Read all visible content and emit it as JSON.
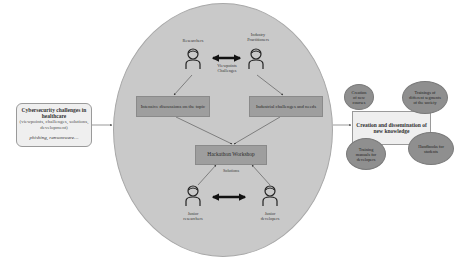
{
  "diagram": {
    "input": {
      "title": "Cybersecurity challenges in healthcare",
      "subtitle": "(viewpoints, challenges, solutions, development)",
      "examples": "phishing, ransomware…"
    },
    "center": {
      "top_left_actor": "Researchers",
      "top_right_actor": "Industry Practitioners",
      "top_exchange_label": "Viewpoints Challenges",
      "left_box": "Intensive discussions on the topic",
      "right_box": "Industrial challenges and needs",
      "hub_box": "Hackathon Workshop",
      "hub_label": "Solutions",
      "bottom_left_actor": "Junior researchers",
      "bottom_right_actor": "Junior developers"
    },
    "output": {
      "title": "Creation and dissemination of new knowledge",
      "outcomes": [
        "Creation of new courses",
        "Trainings of different segments of the society",
        "Training manuals for developers",
        "Handbooks for students"
      ]
    },
    "colors": {
      "circle_fill": "#c9c9c9",
      "box_fill": "#9e9e9e",
      "ellipse_fill": "#8f8f8f",
      "panel_fill": "#efefef"
    }
  }
}
